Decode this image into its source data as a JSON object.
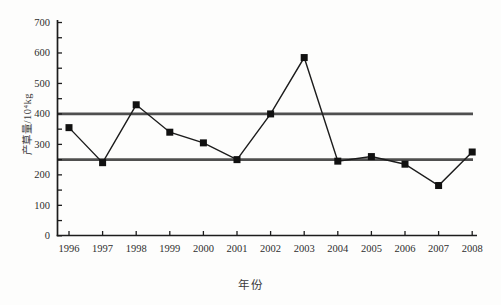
{
  "chart_data": {
    "type": "line",
    "title": "",
    "xlabel": "年份",
    "ylabel": "产草量/10⁴kg",
    "categories": [
      "1996",
      "1997",
      "1998",
      "1999",
      "2000",
      "2001",
      "2002",
      "2003",
      "2004",
      "2005",
      "2006",
      "2007",
      "2008"
    ],
    "series": [
      {
        "name": "产草量",
        "values": [
          355,
          240,
          430,
          340,
          305,
          250,
          400,
          585,
          245,
          260,
          235,
          165,
          275
        ]
      }
    ],
    "reference_lines": [
      400,
      250
    ],
    "ylim": [
      0,
      700
    ],
    "yticks": [
      0,
      100,
      200,
      300,
      400,
      500,
      600,
      700
    ],
    "ytick_interval": 100,
    "yminor_interval": 50,
    "grid": false,
    "legend": "none",
    "marker": "filled-square",
    "colors": {
      "line": "#1c1c1c",
      "marker": "#111111",
      "reference_line": "#4f4f4f",
      "axis": "#1c1c1c",
      "text": "#2e2e2e",
      "background": "#fdfdfc"
    }
  }
}
